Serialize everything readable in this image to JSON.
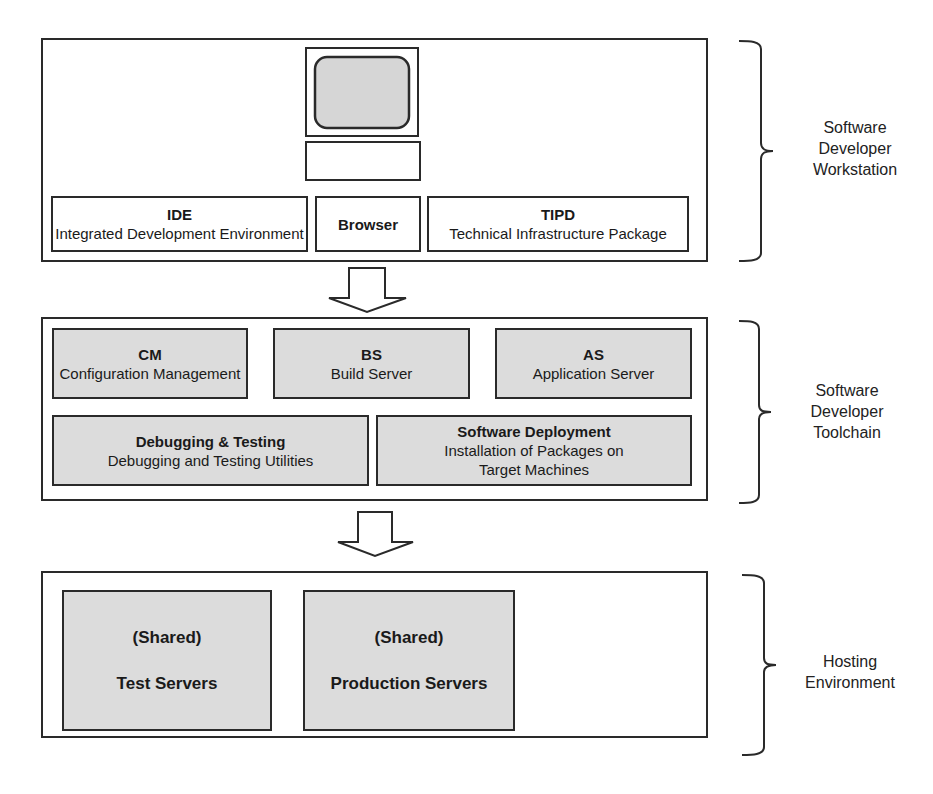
{
  "tiers": [
    {
      "label": "Software Developer Workstation",
      "label_lines": [
        "Software",
        "Developer",
        "Workstation"
      ],
      "components": [
        {
          "title": "IDE",
          "subtitle": "Integrated Development Environment"
        },
        {
          "title": "Browser",
          "subtitle": ""
        },
        {
          "title": "TIPD",
          "subtitle": "Technical Infrastructure Package"
        }
      ]
    },
    {
      "label": "Software Developer Toolchain",
      "label_lines": [
        "Software",
        "Developer",
        "Toolchain"
      ],
      "components": [
        {
          "title": "CM",
          "subtitle": "Configuration Management"
        },
        {
          "title": "BS",
          "subtitle": "Build Server"
        },
        {
          "title": "AS",
          "subtitle": "Application Server"
        },
        {
          "title": "Debugging & Testing",
          "subtitle": "Debugging and Testing Utilities"
        },
        {
          "title": "Software Deployment",
          "subtitle_lines": [
            "Installation of Packages on",
            "Target Machines"
          ]
        }
      ]
    },
    {
      "label": "Hosting Environment",
      "label_lines": [
        "Hosting",
        "Environment"
      ],
      "components": [
        {
          "qualifier": "(Shared)",
          "title": "Test Servers"
        },
        {
          "qualifier": "(Shared)",
          "title": "Production Servers"
        }
      ]
    }
  ],
  "colors": {
    "stroke": "#2a2a2a",
    "component_fill_grey": "#dcdcdc",
    "monitor_screen": "#d6d6d6",
    "background": "#ffffff"
  }
}
